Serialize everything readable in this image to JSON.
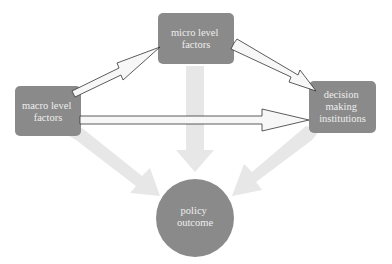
{
  "diagram": {
    "colors": {
      "node_fill": "#8a8a8a",
      "node_text": "#eeeeee",
      "influence_arrow_fill": "#e6e6e6",
      "flow_arrow_fill": "#f7f7f7",
      "flow_arrow_stroke": "#333333",
      "background": "#ffffff"
    },
    "nodes": {
      "micro": {
        "shape": "rounded-rect",
        "lines": [
          "micro level",
          "factors"
        ]
      },
      "macro": {
        "shape": "rounded-rect",
        "lines": [
          "macro level",
          "factors"
        ]
      },
      "decision": {
        "shape": "rounded-rect",
        "lines": [
          "decision",
          "making",
          "institutions"
        ]
      },
      "outcome": {
        "shape": "circle",
        "lines": [
          "policy",
          "outcome"
        ]
      }
    },
    "edges": [
      {
        "from": "macro",
        "to": "micro",
        "style": "outlined-arrow"
      },
      {
        "from": "micro",
        "to": "decision",
        "style": "outlined-arrow"
      },
      {
        "from": "macro",
        "to": "decision",
        "style": "outlined-arrow"
      },
      {
        "from": "macro",
        "to": "outcome",
        "style": "light-gray-broad-arrow"
      },
      {
        "from": "micro",
        "to": "outcome",
        "style": "light-gray-broad-arrow"
      },
      {
        "from": "decision",
        "to": "outcome",
        "style": "light-gray-broad-arrow"
      }
    ]
  }
}
